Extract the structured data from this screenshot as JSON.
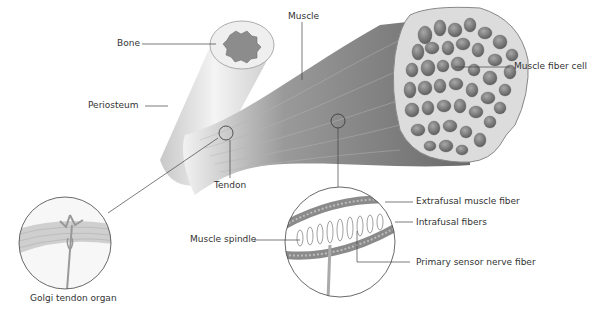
{
  "diagram": {
    "labels": {
      "bone": "Bone",
      "muscle": "Muscle",
      "periosteum": "Periosteum",
      "muscle_fiber_cell": "Muscle fiber cell",
      "tendon": "Tendon",
      "golgi_tendon_organ": "Golgi tendon organ",
      "extrafusal_muscle_fiber": "Extrafusal muscle fiber",
      "intrafusal_fibers": "Intrafusal fibers",
      "muscle_spindle": "Muscle spindle",
      "primary_sensor_nerve_fiber": "Primary sensor nerve fiber"
    },
    "colors": {
      "muscle": "#8a8a8a",
      "muscle_dark": "#5e5e5e",
      "bone": "#e4e4e4",
      "fiber_cell": "#7d7d7d",
      "line": "#444444"
    }
  }
}
